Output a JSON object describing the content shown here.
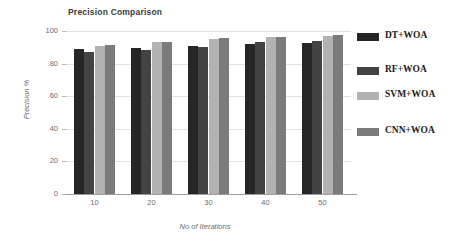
{
  "chart_data": {
    "type": "bar",
    "title": "Precision Comparison",
    "xlabel": "No of Iterations",
    "ylabel": "Precision %",
    "categories": [
      "10",
      "20",
      "30",
      "40",
      "50"
    ],
    "series": [
      {
        "name": "DT+WOA",
        "color": "#262626",
        "values": [
          89,
          89.5,
          91,
          92,
          92.5
        ]
      },
      {
        "name": "RF+WOA",
        "color": "#434343",
        "values": [
          87,
          88.5,
          90,
          93,
          94
        ]
      },
      {
        "name": "SVM+WOA",
        "color": "#b2b2b2",
        "values": [
          91,
          93.5,
          95,
          96.5,
          97
        ]
      },
      {
        "name": "CNN+WOA",
        "color": "#7b7b7b",
        "values": [
          91.5,
          93,
          96,
          96.5,
          97.5
        ]
      }
    ],
    "ylim": [
      0,
      100
    ],
    "yticks": [
      "0",
      "20",
      "40",
      "60",
      "80",
      "100"
    ],
    "grid": true,
    "legend_position": "right"
  },
  "legend": {
    "items": [
      {
        "label": "DT+WOA",
        "color": "#262626",
        "top": 6
      },
      {
        "label": "RF+WOA",
        "color": "#434343",
        "top": 40
      },
      {
        "label": "SVM+WOA",
        "color": "#b2b2b2",
        "top": 65
      },
      {
        "label": "CNN+WOA",
        "color": "#7b7b7b",
        "top": 101
      }
    ]
  }
}
